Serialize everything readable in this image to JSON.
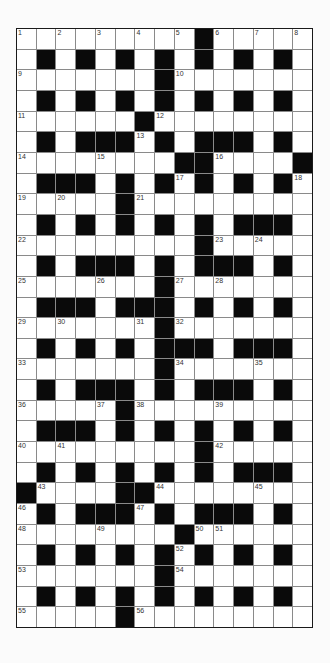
{
  "puzzle": {
    "type": "crossword",
    "columns": 15,
    "rows": 29,
    "colors": {
      "black_square": "#0a0a0a",
      "white_square": "#ffffff",
      "grid_line": "#8a8a8a"
    },
    "layout": [
      ".........#.....",
      ".#.#.#.#.#.#.#.",
      ".......#.......",
      ".#.#.#.#.#.#.#.",
      "......#........",
      ".#.###.#.###.#.",
      "........##....#",
      ".###.#.#.#.#.#.",
      ".....#.........",
      ".#.#.#.#.#.###.",
      ".........#.....",
      ".#.###.#.###.#.",
      ".......#.......",
      ".###.###.#.#.#.",
      ".......#.......",
      ".#.#.#.###.###.",
      ".......#.......",
      ".#.###.#.###.#.",
      ".....#.........",
      ".###.#.#.#.#.#.",
      ".........#.....",
      ".#.#.#.#.#.###.",
      "#....##........",
      ".#.###.#.###.#.",
      "........#......",
      ".#.#.#.#.#.#.#.",
      ".......#.......",
      ".#.#.#.#.#.#.#.",
      ".....#........."
    ],
    "numbers": [
      {
        "row": 0,
        "col": 0,
        "n": "1"
      },
      {
        "row": 0,
        "col": 2,
        "n": "2"
      },
      {
        "row": 0,
        "col": 4,
        "n": "3"
      },
      {
        "row": 0,
        "col": 6,
        "n": "4"
      },
      {
        "row": 0,
        "col": 8,
        "n": "5"
      },
      {
        "row": 0,
        "col": 10,
        "n": "6"
      },
      {
        "row": 0,
        "col": 12,
        "n": "7"
      },
      {
        "row": 0,
        "col": 14,
        "n": "8"
      },
      {
        "row": 2,
        "col": 0,
        "n": "9"
      },
      {
        "row": 2,
        "col": 8,
        "n": "10"
      },
      {
        "row": 4,
        "col": 0,
        "n": "11"
      },
      {
        "row": 4,
        "col": 7,
        "n": "12"
      },
      {
        "row": 5,
        "col": 6,
        "n": "13"
      },
      {
        "row": 6,
        "col": 0,
        "n": "14"
      },
      {
        "row": 6,
        "col": 4,
        "n": "15"
      },
      {
        "row": 6,
        "col": 10,
        "n": "16"
      },
      {
        "row": 7,
        "col": 8,
        "n": "17"
      },
      {
        "row": 7,
        "col": 14,
        "n": "18"
      },
      {
        "row": 8,
        "col": 0,
        "n": "19"
      },
      {
        "row": 8,
        "col": 2,
        "n": "20"
      },
      {
        "row": 8,
        "col": 6,
        "n": "21"
      },
      {
        "row": 10,
        "col": 0,
        "n": "22"
      },
      {
        "row": 10,
        "col": 10,
        "n": "23"
      },
      {
        "row": 10,
        "col": 12,
        "n": "24"
      },
      {
        "row": 12,
        "col": 0,
        "n": "25"
      },
      {
        "row": 12,
        "col": 4,
        "n": "26"
      },
      {
        "row": 12,
        "col": 8,
        "n": "27"
      },
      {
        "row": 12,
        "col": 10,
        "n": "28"
      },
      {
        "row": 14,
        "col": 0,
        "n": "29"
      },
      {
        "row": 14,
        "col": 2,
        "n": "30"
      },
      {
        "row": 14,
        "col": 6,
        "n": "31"
      },
      {
        "row": 14,
        "col": 8,
        "n": "32"
      },
      {
        "row": 16,
        "col": 0,
        "n": "33"
      },
      {
        "row": 16,
        "col": 8,
        "n": "34"
      },
      {
        "row": 16,
        "col": 12,
        "n": "35"
      },
      {
        "row": 18,
        "col": 0,
        "n": "36"
      },
      {
        "row": 18,
        "col": 4,
        "n": "37"
      },
      {
        "row": 18,
        "col": 6,
        "n": "38"
      },
      {
        "row": 18,
        "col": 10,
        "n": "39"
      },
      {
        "row": 20,
        "col": 0,
        "n": "40"
      },
      {
        "row": 20,
        "col": 2,
        "n": "41"
      },
      {
        "row": 20,
        "col": 10,
        "n": "42"
      },
      {
        "row": 22,
        "col": 1,
        "n": "43"
      },
      {
        "row": 22,
        "col": 7,
        "n": "44"
      },
      {
        "row": 22,
        "col": 12,
        "n": "45"
      },
      {
        "row": 23,
        "col": 0,
        "n": "46"
      },
      {
        "row": 23,
        "col": 6,
        "n": "47"
      },
      {
        "row": 24,
        "col": 0,
        "n": "48"
      },
      {
        "row": 24,
        "col": 4,
        "n": "49"
      },
      {
        "row": 24,
        "col": 9,
        "n": "50"
      },
      {
        "row": 24,
        "col": 10,
        "n": "51"
      },
      {
        "row": 25,
        "col": 8,
        "n": "52"
      },
      {
        "row": 26,
        "col": 0,
        "n": "53"
      },
      {
        "row": 26,
        "col": 8,
        "n": "54"
      },
      {
        "row": 28,
        "col": 0,
        "n": "55"
      },
      {
        "row": 28,
        "col": 6,
        "n": "56"
      }
    ]
  }
}
